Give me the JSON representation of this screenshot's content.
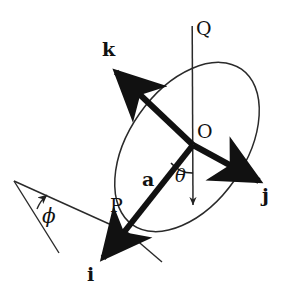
{
  "figure": {
    "type": "vector-diagram",
    "background_color": "#ffffff",
    "stroke_color": "#111111",
    "thin_stroke_color": "#333333",
    "canvas": {
      "width": 284,
      "height": 292
    }
  },
  "labels": {
    "k": "k",
    "j": "j",
    "i": "i",
    "a": "a",
    "O": "O",
    "P": "P",
    "Q": "Q",
    "theta": "θ",
    "phi": "ϕ"
  },
  "geometry": {
    "origin": {
      "name": "O",
      "x": 193,
      "y": 145
    },
    "point_p": {
      "name": "P",
      "x": 121,
      "y": 236
    },
    "axes": [
      {
        "name": "k",
        "from": [
          193,
          145
        ],
        "to": [
          112,
          68
        ],
        "bold": true
      },
      {
        "name": "j",
        "from": [
          193,
          145
        ],
        "to": [
          264,
          184
        ],
        "bold": true
      },
      {
        "name": "i",
        "from": [
          193,
          145
        ],
        "to": [
          100,
          262
        ],
        "bold": true
      }
    ],
    "vector_a": {
      "name": "a",
      "from": [
        193,
        145
      ],
      "to": [
        121,
        236
      ],
      "bold": true
    },
    "line_q": {
      "name": "Q",
      "from": [
        192,
        26
      ],
      "to": [
        193,
        208
      ],
      "bold": false
    },
    "ellipse": {
      "cx": 187,
      "cy": 147,
      "rx": 95,
      "ry": 58,
      "rotation_deg": -55
    },
    "angle_theta": {
      "vertex": [
        193,
        145
      ],
      "radius": 28
    },
    "angle_phi": {
      "vertex": [
        14,
        181
      ],
      "radius": 36
    }
  }
}
